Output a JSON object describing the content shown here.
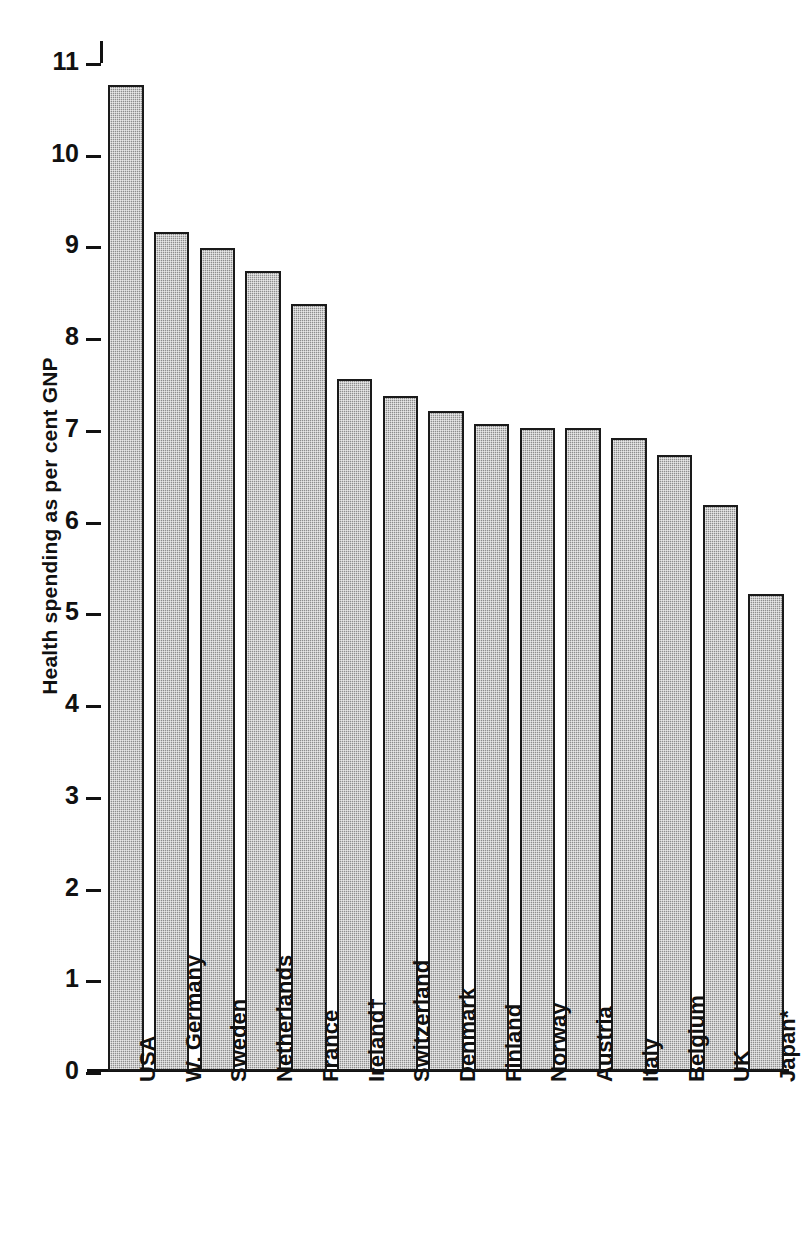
{
  "chart_data": {
    "type": "bar",
    "title": "",
    "xlabel": "",
    "ylabel": "Health spending as per cent GNP",
    "ylim": [
      0,
      11
    ],
    "yticks": [
      0,
      1,
      2,
      3,
      4,
      5,
      6,
      7,
      8,
      9,
      10,
      11
    ],
    "ytick_labels": [
      "0",
      "1",
      "2",
      "3",
      "4",
      "5",
      "6",
      "7",
      "8",
      "9",
      "10",
      "11"
    ],
    "grid": false,
    "legend": "none",
    "orientation": "vertical",
    "bar_color": "#8d8d8d",
    "bar_edge_color": "#1a1a1a",
    "background_color": "#ffffff",
    "categories": [
      "USA",
      "W. Germany",
      "Sweden",
      "Netherlands",
      "France",
      "Ireland†",
      "Switzerland",
      "Denmark",
      "Finland",
      "Norway",
      "Austria",
      "Italy",
      "Belgium",
      "UK",
      "Japan*"
    ],
    "values": [
      10.75,
      9.15,
      8.97,
      8.72,
      8.36,
      7.54,
      7.36,
      7.2,
      7.05,
      7.01,
      7.01,
      6.9,
      6.72,
      6.17,
      5.2
    ],
    "annotations": [
      "† marks Ireland",
      "* marks Japan"
    ]
  }
}
